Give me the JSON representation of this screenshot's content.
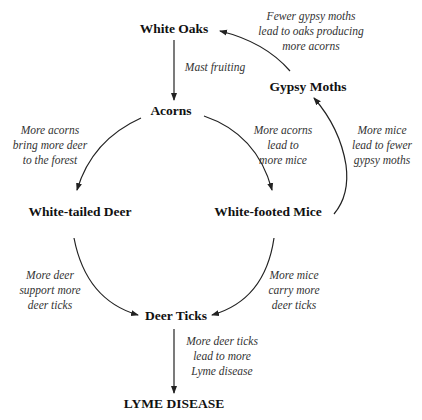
{
  "nodes": {
    "white_oaks": "White Oaks",
    "acorns": "Acorns",
    "gypsy_moths": "Gypsy Moths",
    "white_tailed_deer": "White-tailed Deer",
    "white_footed_mice": "White-footed Mice",
    "deer_ticks": "Deer Ticks",
    "lyme_disease": "LYME DISEASE"
  },
  "edges": [
    {
      "from": "White Oaks",
      "to": "Acorns",
      "label": [
        "Mast fruiting"
      ]
    },
    {
      "from": "Acorns",
      "to": "White-tailed Deer",
      "label": [
        "More acorns",
        "bring more deer",
        "to the forest"
      ]
    },
    {
      "from": "Acorns",
      "to": "White-footed Mice",
      "label": [
        "More acorns",
        "lead to",
        "more mice"
      ]
    },
    {
      "from": "White-footed Mice",
      "to": "Gypsy Moths",
      "label": [
        "More mice",
        "lead to fewer",
        "gypsy moths"
      ]
    },
    {
      "from": "Gypsy Moths",
      "to": "White Oaks",
      "label": [
        "Fewer gypsy moths",
        "lead to oaks producing",
        "more acorns"
      ]
    },
    {
      "from": "White-tailed Deer",
      "to": "Deer Ticks",
      "label": [
        "More deer",
        "support more",
        "deer ticks"
      ]
    },
    {
      "from": "White-footed Mice",
      "to": "Deer Ticks",
      "label": [
        "More mice",
        "carry more",
        "deer ticks"
      ]
    },
    {
      "from": "Deer Ticks",
      "to": "Lyme Disease",
      "label": [
        "More deer ticks",
        "lead to more",
        "Lyme disease"
      ]
    }
  ],
  "colors": {
    "line": "#222222",
    "text": "#111111",
    "label": "#333333"
  }
}
